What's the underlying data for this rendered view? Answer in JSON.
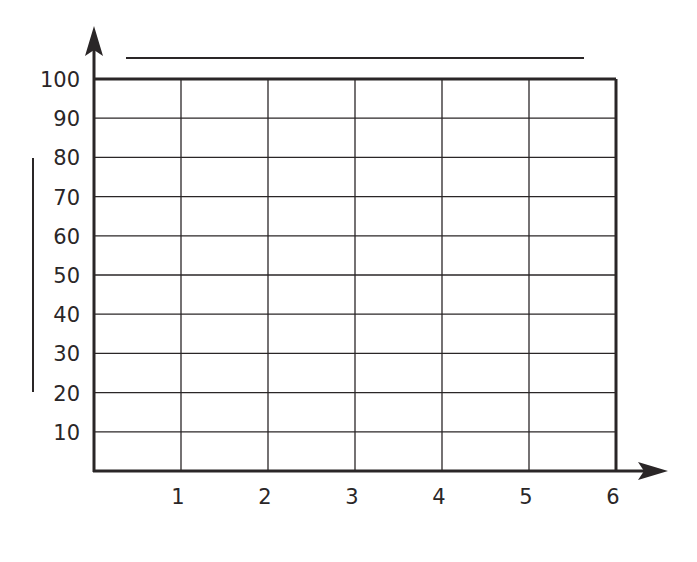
{
  "chart_data": {
    "type": "line",
    "title": "",
    "xlabel": "",
    "ylabel": "",
    "x_ticks": [
      "1",
      "2",
      "3",
      "4",
      "5",
      "6"
    ],
    "y_ticks": [
      "10",
      "20",
      "30",
      "40",
      "50",
      "60",
      "70",
      "80",
      "90",
      "100"
    ],
    "xlim": [
      0,
      6
    ],
    "ylim": [
      0,
      100
    ],
    "grid": true,
    "series": [],
    "annotations": [
      "blank title line",
      "blank y-axis label line"
    ]
  },
  "colors": {
    "ink": "#2a2627",
    "background": "#ffffff"
  }
}
